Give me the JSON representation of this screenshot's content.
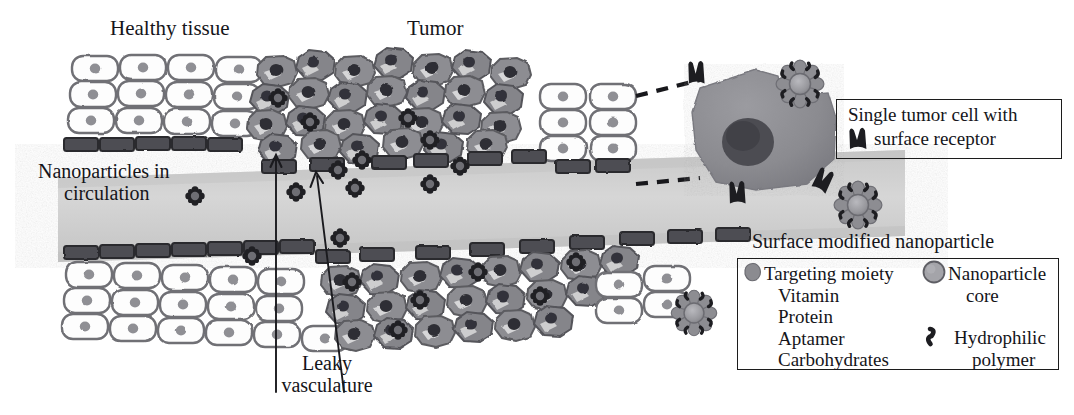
{
  "figure": {
    "title_alt": "Tumor-targeted nanoparticle delivery via the EPR effect",
    "labels": {
      "healthy_tissue": "Healthy tissue",
      "tumor": "Tumor",
      "nanoparticles_in_circulation_line1": "Nanoparticles in",
      "nanoparticles_in_circulation_line2": "circulation",
      "leaky_vasculature_line1": "Leaky",
      "leaky_vasculature_line2": "vasculature",
      "surface_modified_nanoparticle": "Surface modified nanoparticle"
    }
  },
  "receptor_box": {
    "line1": "Single tumor cell with",
    "line2": "surface receptor",
    "icon": "receptor-glyph"
  },
  "legend_box": {
    "left_column": {
      "heading": "Targeting moiety",
      "items": [
        "Vitamin",
        "Protein",
        "Aptamer",
        "Carbohydrates"
      ],
      "icon": "targeting-moiety-icon"
    },
    "right_column": {
      "entry1_line1": "Nanoparticle",
      "entry1_line2": "core",
      "entry1_icon": "nanoparticle-core-icon",
      "entry2_line1": "Hydrophilic",
      "entry2_line2": "polymer",
      "entry2_icon": "hydrophilic-polymer-icon"
    }
  },
  "colors": {
    "ink": "#1c1c1c",
    "healthy_cell_fill": "#fdfdfd",
    "healthy_cell_stroke": "#6e6e72",
    "nucleus": "#8d8d92",
    "tumor_cell_fill": "#8e8e93",
    "tumor_cell_dark": "#5b5b60",
    "tumor_nucleus": "#2e2e33",
    "endothelium": "#4a4a4e",
    "vessel_lumen": "#d2d2d2",
    "big_cell_fill": "#8c8c91",
    "big_cell_nucleus": "#4a4a4f",
    "nanoparticle_core": "#9a9a9f",
    "nanoparticle_petal": "#8a8a8f",
    "polymer": "#1f1f22"
  },
  "counts": {
    "healthy_cell_columns_top": 4,
    "healthy_cell_rows": 3,
    "arrows_leaky_vasculature": 2,
    "dashed_connectors": 2,
    "free_nanoparticles_in_vessel": 6
  }
}
